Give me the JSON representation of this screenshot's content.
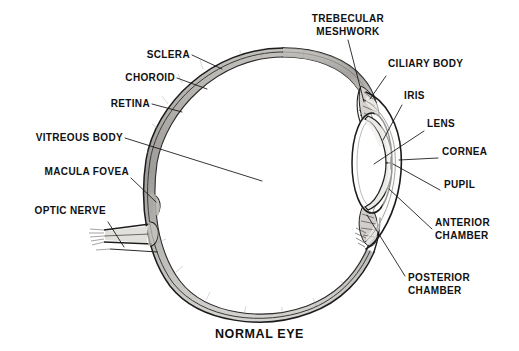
{
  "figure": {
    "caption": "NORMAL EYE",
    "style": "black and white pen-and-ink anatomical line drawing",
    "background_color": "#ffffff",
    "ink_color": "#111111"
  },
  "labels_left": [
    {
      "id": "sclera",
      "text": "SCLERA"
    },
    {
      "id": "choroid",
      "text": "CHOROID"
    },
    {
      "id": "retina",
      "text": "RETINA"
    },
    {
      "id": "vitreous-body",
      "text": "VITREOUS BODY"
    },
    {
      "id": "macula-fovea",
      "text": "MACULA FOVEA"
    },
    {
      "id": "optic-nerve",
      "text": "OPTIC NERVE"
    }
  ],
  "labels_top": [
    {
      "id": "trebecular-meshwork",
      "line1": "TREBECULAR",
      "line2": "MESHWORK"
    }
  ],
  "labels_right": [
    {
      "id": "ciliary-body",
      "text": "CILIARY BODY"
    },
    {
      "id": "iris",
      "text": "IRIS"
    },
    {
      "id": "lens",
      "text": "LENS"
    },
    {
      "id": "cornea",
      "text": "CORNEA"
    },
    {
      "id": "pupil",
      "text": "PUPIL"
    }
  ],
  "labels_right_two_line": [
    {
      "id": "anterior-chamber",
      "line1": "ANTERIOR",
      "line2": "CHAMBER"
    },
    {
      "id": "posterior-chamber",
      "line1": "POSTERIOR",
      "line2": "CHAMBER"
    }
  ]
}
